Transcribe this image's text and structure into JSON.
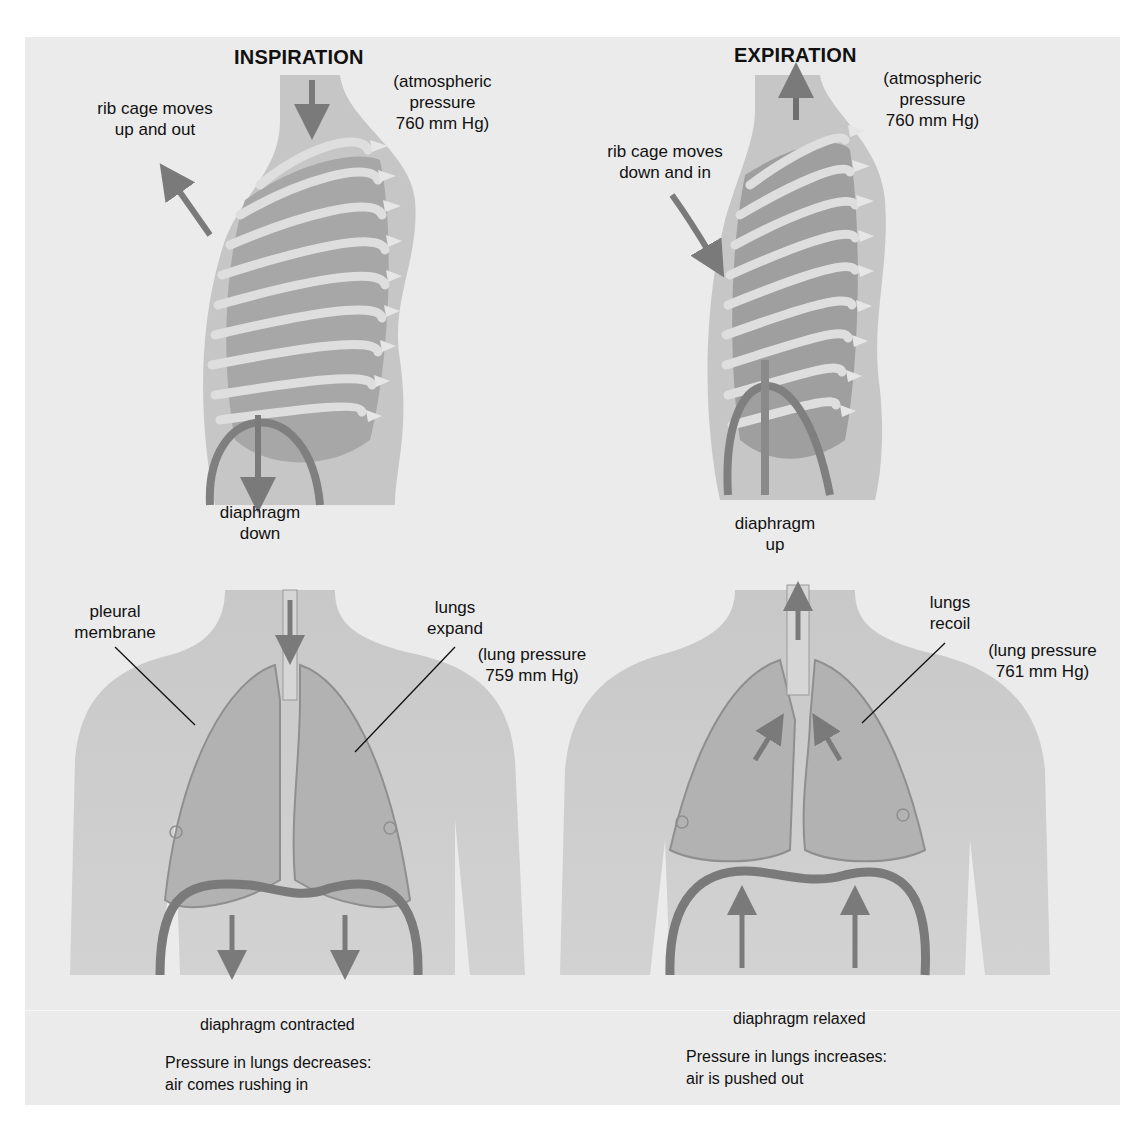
{
  "colors": {
    "panel_bg": "#ebebeb",
    "skin": "#c8c8c8",
    "skin_dark": "#a9a9a9",
    "lung": "#b3b3b3",
    "rib": "#dcdcdc",
    "arrow": "#7a7a7a",
    "diaphragm": "#858585",
    "text": "#111111"
  },
  "inspiration": {
    "title": "INSPIRATION",
    "rib_label": "rib cage moves\nup and out",
    "atmospheric_label": "(atmospheric\npressure\n760 mm Hg)",
    "diaphragm_label": "diaphragm\ndown",
    "pleural_label": "pleural\nmembrane",
    "lungs_label": "lungs\nexpand",
    "lung_pressure_label": "(lung pressure\n759 mm Hg)",
    "diaphragm_state": "diaphragm contracted",
    "summary": "Pressure in lungs decreases:\nair comes rushing in"
  },
  "expiration": {
    "title": "EXPIRATION",
    "rib_label": "rib cage moves\ndown and in",
    "atmospheric_label": "(atmospheric\npressure\n760 mm Hg)",
    "diaphragm_label": "diaphragm\nup",
    "lungs_label": "lungs\nrecoil",
    "lung_pressure_label": "(lung pressure\n761 mm Hg)",
    "diaphragm_state": "diaphragm relaxed",
    "summary": "Pressure in lungs increases:\nair is pushed out"
  }
}
